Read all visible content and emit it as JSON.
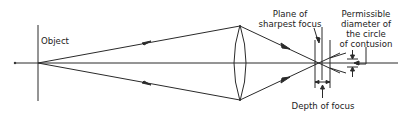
{
  "diagram": {
    "labels": {
      "object": "Object",
      "plane_line1": "Plane of",
      "plane_line2": "sharpest focus",
      "perm_line1": "Permissible",
      "perm_line2": "diameter of",
      "perm_line3": "the circle",
      "perm_line4": "of contusion",
      "depth": "Depth of focus"
    },
    "colors": {
      "line": "#2a2a2a",
      "background": "#ffffff"
    }
  }
}
